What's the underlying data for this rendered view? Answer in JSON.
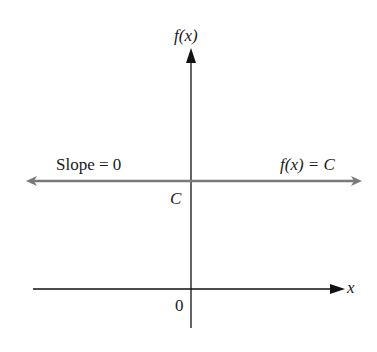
{
  "diagram": {
    "y_axis": {
      "label": "f(x)"
    },
    "x_axis": {
      "label": "x"
    },
    "origin_label": "0",
    "intercept_label": "C",
    "line": {
      "slope_label": "Slope = 0",
      "equation_label": "f(x) = C",
      "color": "#7a7a7a"
    },
    "axis_color": "#111111"
  }
}
